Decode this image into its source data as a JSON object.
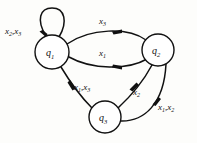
{
  "figure": {
    "kind": "state-transition-diagram",
    "width": 197,
    "height": 143,
    "background_color": "#fdfdfb",
    "ink_color": "#111111"
  },
  "states": [
    {
      "id": "q1",
      "base": "q",
      "subscript": "1",
      "label": "q1",
      "cx": 52,
      "cy": 52,
      "r": 17
    },
    {
      "id": "q2",
      "base": "q",
      "subscript": "2",
      "label": "q2",
      "cx": 158,
      "cy": 50,
      "r": 16
    },
    {
      "id": "q3",
      "base": "q",
      "subscript": "3",
      "label": "q3",
      "cx": 105,
      "cy": 117,
      "r": 16
    }
  ],
  "transitions": [
    {
      "id": "q1-self",
      "from": "q1",
      "to": "q1",
      "symbols": [
        {
          "base": "x",
          "subscript": "2"
        },
        {
          "base": "x",
          "subscript": "3"
        }
      ],
      "label": "x2 , x3",
      "label_x": 5,
      "label_y": 34
    },
    {
      "id": "q1-to-q2-top",
      "from": "q1",
      "to": "q2",
      "symbols": [
        {
          "base": "x",
          "subscript": "3"
        }
      ],
      "label": "x3",
      "label_x": 99,
      "label_y": 24
    },
    {
      "id": "q2-to-q1-middle",
      "from": "q2",
      "to": "q1",
      "symbols": [
        {
          "base": "x",
          "subscript": "1"
        }
      ],
      "label": "x1",
      "label_x": 99,
      "label_y": 56
    },
    {
      "id": "q1-to-q3",
      "from": "q1",
      "to": "q3",
      "symbols": [
        {
          "base": "x",
          "subscript": "1"
        },
        {
          "base": "x",
          "subscript": "3"
        }
      ],
      "label": "x1 ,x3",
      "label_x": 74,
      "label_y": 90
    },
    {
      "id": "q3-to-q2",
      "from": "q3",
      "to": "q2",
      "symbols": [
        {
          "base": "x",
          "subscript": "2"
        }
      ],
      "label": "x2",
      "label_x": 133,
      "label_y": 95
    },
    {
      "id": "q3-to-q2-outer",
      "from": "q3",
      "to": "q2",
      "symbols": [
        {
          "base": "x",
          "subscript": "1"
        },
        {
          "base": "x",
          "subscript": "2"
        }
      ],
      "label": "x1 ,x2",
      "label_x": 158,
      "label_y": 110
    }
  ]
}
